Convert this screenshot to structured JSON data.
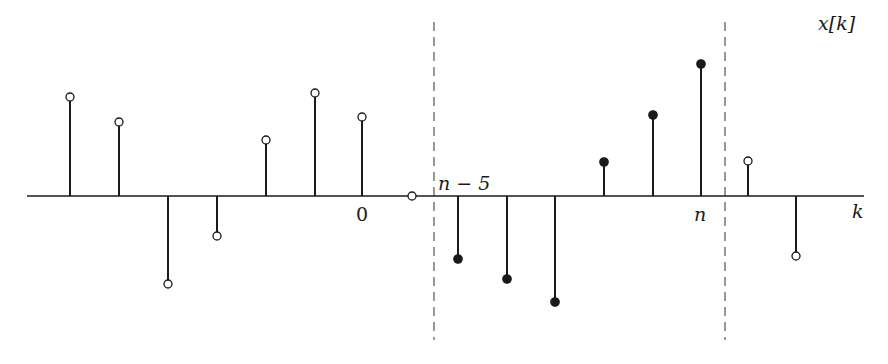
{
  "chart_data": {
    "type": "stem",
    "title": "x[k]",
    "xlabel": "k",
    "ylabel": "",
    "axis": {
      "y_px": 196,
      "x_start_px": 27,
      "x_end_px": 864
    },
    "tick_labels": [
      {
        "text": "0",
        "index": 6,
        "italic": false
      },
      {
        "text": "n − 5",
        "index": 8,
        "italic": true
      },
      {
        "text": "n",
        "index": 13,
        "italic": true
      }
    ],
    "window": {
      "start_index": 8,
      "end_index": 13,
      "dashed_lines_x_px": [
        434,
        725
      ],
      "y_top_px": 22,
      "y_bottom_px": 340
    },
    "samples": [
      {
        "x_px": 70,
        "y_px": 97,
        "filled": false
      },
      {
        "x_px": 119,
        "y_px": 122,
        "filled": false
      },
      {
        "x_px": 168,
        "y_px": 284,
        "filled": false
      },
      {
        "x_px": 217,
        "y_px": 236,
        "filled": false
      },
      {
        "x_px": 266,
        "y_px": 140,
        "filled": false
      },
      {
        "x_px": 315,
        "y_px": 93,
        "filled": false
      },
      {
        "x_px": 362,
        "y_px": 117,
        "filled": false
      },
      {
        "x_px": 412,
        "y_px": 196,
        "filled": false
      },
      {
        "x_px": 458,
        "y_px": 259,
        "filled": true
      },
      {
        "x_px": 507,
        "y_px": 279,
        "filled": true
      },
      {
        "x_px": 555,
        "y_px": 302,
        "filled": true
      },
      {
        "x_px": 604,
        "y_px": 162,
        "filled": true
      },
      {
        "x_px": 653,
        "y_px": 115,
        "filled": true
      },
      {
        "x_px": 701,
        "y_px": 64,
        "filled": true
      },
      {
        "x_px": 748,
        "y_px": 161,
        "filled": false
      },
      {
        "x_px": 796,
        "y_px": 256,
        "filled": false
      }
    ],
    "legend": "filled samples lie inside window [n−5, n]; hollow samples lie outside"
  },
  "labels": {
    "title": "x[k]",
    "k": "k",
    "zero": "0",
    "n_minus_5": "n − 5",
    "n": "n"
  },
  "colors": {
    "ink": "#1a1a1a",
    "dash": "#555555",
    "background": "#ffffff"
  }
}
